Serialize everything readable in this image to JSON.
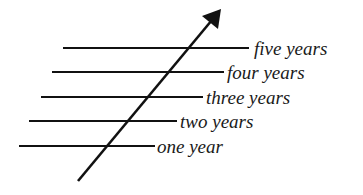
{
  "diagram": {
    "type": "timeline-levels",
    "labels": [
      "one year",
      "two years",
      "three years",
      "four years",
      "five years"
    ],
    "arrow": {
      "direction": "up-right",
      "meaning": "increasing time"
    },
    "colors": {
      "ink": "#111111",
      "background": "#ffffff"
    }
  }
}
